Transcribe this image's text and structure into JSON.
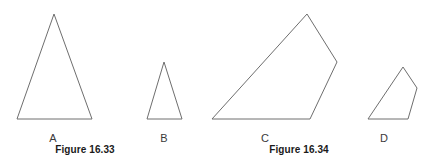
{
  "page": {
    "width": 434,
    "height": 163,
    "background": "#ffffff",
    "stroke_color": "#6e6e6e",
    "stroke_width": 1,
    "label_color": "#3a3a3a",
    "caption_color": "#1a1a1a"
  },
  "figures": [
    {
      "caption": "Figure 16.33",
      "caption_x": 85,
      "caption_y": 144,
      "shapes": [
        {
          "label": "A",
          "label_x": 53,
          "label_y": 132,
          "type": "triangle",
          "points": "54,14 92,119 17,119"
        },
        {
          "label": "B",
          "label_x": 164,
          "label_y": 132,
          "type": "triangle",
          "points": "164,62 182,119 147,119"
        }
      ]
    },
    {
      "caption": "Figure 16.34",
      "caption_x": 299,
      "caption_y": 144,
      "shapes": [
        {
          "label": "C",
          "label_x": 265,
          "label_y": 132,
          "type": "quadrilateral",
          "points": "307,14 337,62 310,119 212,119"
        },
        {
          "label": "D",
          "label_x": 384,
          "label_y": 132,
          "type": "quadrilateral",
          "points": "403,67 417,88 408,119 368,119"
        }
      ]
    }
  ]
}
